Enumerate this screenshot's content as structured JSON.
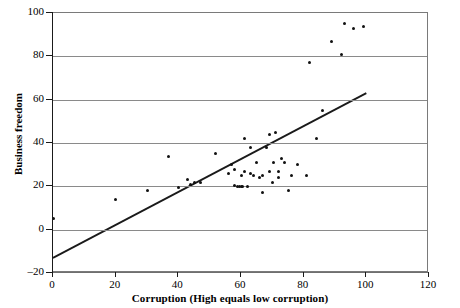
{
  "chart_data": {
    "type": "scatter",
    "title": "",
    "xlabel": "Corruption (High equals low corruption)",
    "ylabel": "Business freedom",
    "xlim": [
      0,
      120
    ],
    "ylim": [
      -20,
      100
    ],
    "xticks": [
      0,
      20,
      40,
      60,
      80,
      100,
      120
    ],
    "yticks": [
      -20,
      0,
      20,
      40,
      60,
      80,
      100
    ],
    "grid": "horizontal",
    "legend": "none",
    "series": [
      {
        "name": "countries",
        "marker": "dot",
        "color": "#111111",
        "points": [
          [
            0,
            5
          ],
          [
            20,
            14
          ],
          [
            30,
            18
          ],
          [
            37,
            34
          ],
          [
            40,
            19.5
          ],
          [
            43,
            23
          ],
          [
            44,
            21
          ],
          [
            45,
            22
          ],
          [
            47,
            22
          ],
          [
            52,
            35
          ],
          [
            56,
            26
          ],
          [
            57,
            30
          ],
          [
            58,
            28
          ],
          [
            58,
            20.5
          ],
          [
            59,
            20
          ],
          [
            59.5,
            20
          ],
          [
            60,
            20
          ],
          [
            60.5,
            20
          ],
          [
            60,
            25
          ],
          [
            61,
            42
          ],
          [
            61,
            27
          ],
          [
            62,
            20
          ],
          [
            63,
            26
          ],
          [
            63,
            38
          ],
          [
            64,
            25
          ],
          [
            65,
            31
          ],
          [
            66,
            24
          ],
          [
            67,
            17
          ],
          [
            67,
            25
          ],
          [
            68,
            38
          ],
          [
            69,
            27
          ],
          [
            69,
            44
          ],
          [
            70,
            22
          ],
          [
            70.5,
            31
          ],
          [
            71,
            45
          ],
          [
            72,
            24
          ],
          [
            72,
            27
          ],
          [
            73,
            33
          ],
          [
            74,
            31
          ],
          [
            75,
            18
          ],
          [
            76,
            25
          ],
          [
            78,
            30
          ],
          [
            81,
            25
          ],
          [
            82,
            77
          ],
          [
            84,
            42
          ],
          [
            86,
            55
          ],
          [
            89,
            87
          ],
          [
            92,
            81
          ],
          [
            93,
            95
          ],
          [
            96,
            93
          ],
          [
            99,
            94
          ]
        ]
      }
    ],
    "trendline": {
      "x": [
        0,
        100
      ],
      "y": [
        -13,
        63
      ],
      "color": "#1a1a1a"
    }
  }
}
